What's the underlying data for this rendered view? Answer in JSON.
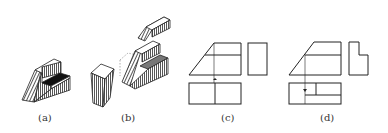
{
  "figure": {
    "panels": [
      {
        "id": "a",
        "label": "(a)",
        "kind": "isometric-solid",
        "description": "Stepped block with slanted front face, top raised block, dark groove"
      },
      {
        "id": "b",
        "label": "(b)",
        "kind": "exploded-isometric",
        "description": "Exploded view: slanted top piece, removed wedge block, base body with groove"
      },
      {
        "id": "c",
        "label": "(c)",
        "kind": "orthographic-views",
        "description": "Front, side and top views (incomplete)"
      },
      {
        "id": "d",
        "label": "(d)",
        "kind": "orthographic-views",
        "description": "Front, side (L-notch) and top views with projection line"
      }
    ]
  },
  "colors": {
    "line": "#222222",
    "hatch": "#444444",
    "fill_dark": "#111111",
    "background": "#ffffff"
  }
}
